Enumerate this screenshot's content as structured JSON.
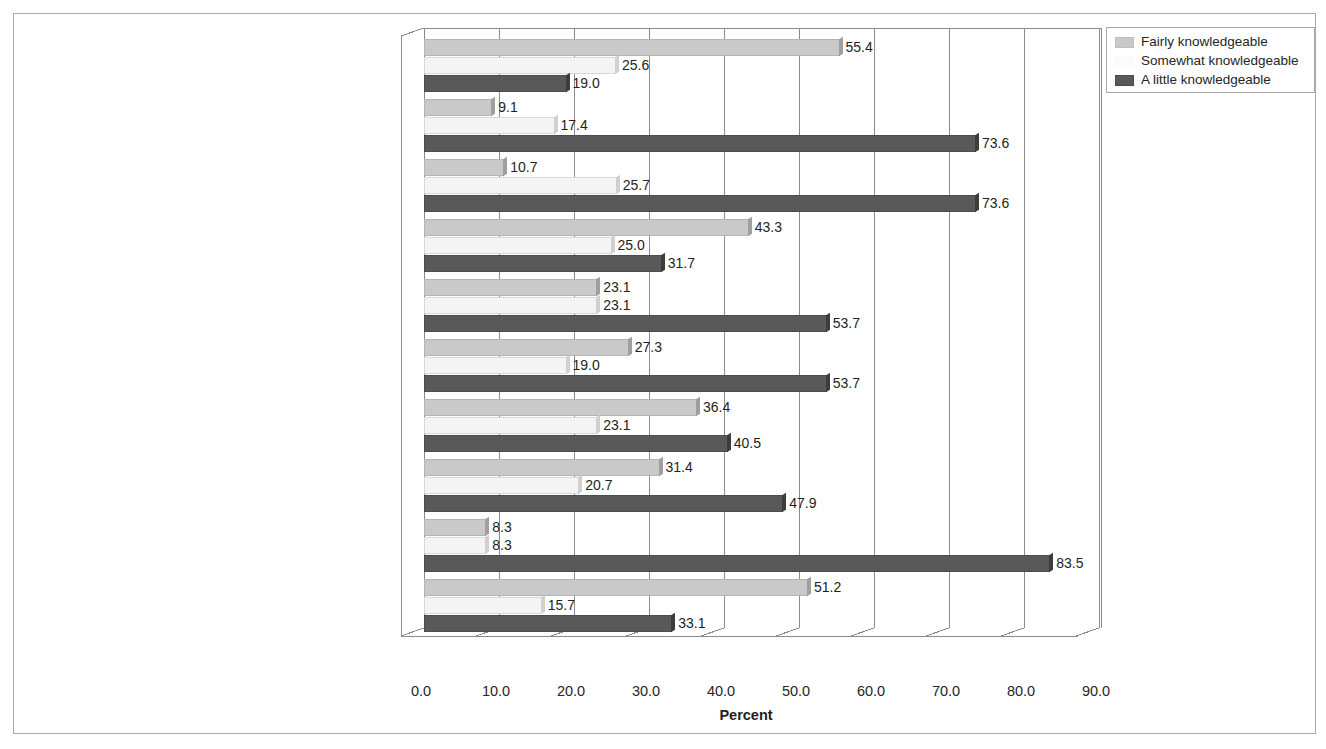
{
  "figure": {
    "x_axis_title": "Percent"
  },
  "legend": {
    "items": [
      {
        "label": "Fairly knowledgeable",
        "color": "#c9c9c9",
        "swatch": "legend-swatch-fairly"
      },
      {
        "label": "Somewhat knowledgeable",
        "color": "#fbfbfb",
        "swatch": "legend-swatch-somewhat"
      },
      {
        "label": "A little knowledgeable",
        "color": "#595959",
        "swatch": "legend-swatch-a-little"
      }
    ]
  },
  "chart_data": {
    "type": "bar",
    "orientation": "horizontal",
    "title": "",
    "subtitle": "",
    "xlabel": "Percent",
    "ylabel": "",
    "xlim": [
      0.0,
      90.0
    ],
    "xticks": [
      "0.0",
      "10.0",
      "20.0",
      "30.0",
      "40.0",
      "50.0",
      "60.0",
      "70.0",
      "80.0",
      "90.0"
    ],
    "xtick_values": [
      0,
      10,
      20,
      30,
      40,
      50,
      60,
      70,
      80,
      90
    ],
    "grid": true,
    "grid_axis": "x",
    "legend_position": "top-right",
    "categories": [
      "Social Networks (e.g. Facebook, MySpace)",
      "Social bookmaking (e.g. del.icio.us, Social Marker)",
      "Podcasts (e.g. Juice, Podcaster, Podproducer)",
      "Photos / multimedia sharing (e.g. Flickr, YouTube)",
      "Blogs (e.g. The Huffington Post, TechCrunch)",
      "Micro-blogging (e.g. Twitter, Tumblr)",
      "Wiki’s (e.g. Wikipedia)",
      "RSS feeds (e.g. FeedReader, Google Reader)",
      "Data mashups (e.g. Ushahidi)",
      "Messenger application (e.g. MXit, Skype)"
    ],
    "series": [
      {
        "name": "Fairly knowledgeable",
        "color": "#c9c9c9",
        "values": [
          55.4,
          9.1,
          10.7,
          43.3,
          23.1,
          27.3,
          36.4,
          31.4,
          8.3,
          51.2
        ],
        "labels": [
          "55.4",
          "9.1",
          "10.7",
          "43.3",
          "23.1",
          "27.3",
          "36.4",
          "31.4",
          "8.3",
          "51.2"
        ]
      },
      {
        "name": "Somewhat knowledgeable",
        "color": "#f4f4f4",
        "values": [
          25.6,
          17.4,
          25.7,
          25.0,
          23.1,
          19.0,
          23.1,
          20.7,
          8.3,
          15.7
        ],
        "labels": [
          "25.6",
          "17.4",
          "25.7",
          "25.0",
          "23.1",
          "19.0",
          "23.1",
          "20.7",
          "8.3",
          "15.7"
        ]
      },
      {
        "name": "A little knowledgeable",
        "color": "#595959",
        "values": [
          19.0,
          73.6,
          73.6,
          31.7,
          53.7,
          53.7,
          40.5,
          47.9,
          83.5,
          33.1
        ],
        "labels": [
          "19.0",
          "73.6",
          "73.6",
          "31.7",
          "53.7",
          "53.7",
          "40.5",
          "47.9",
          "83.5",
          "33.1"
        ]
      }
    ]
  }
}
